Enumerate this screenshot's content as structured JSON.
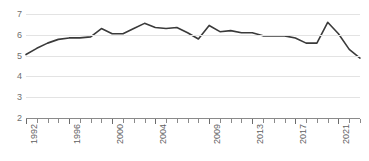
{
  "chart_data": {
    "type": "line",
    "title": "",
    "subtitle": "",
    "xlabel": "",
    "ylabel": "",
    "xlim": [
      1992,
      2023
    ],
    "ylim": [
      2,
      7
    ],
    "yticks": [
      2,
      3,
      4,
      5,
      6,
      7
    ],
    "ytick_labels": [
      "2",
      "3",
      "4",
      "5",
      "6",
      "7"
    ],
    "grid": true,
    "legend_position": "none",
    "x_tick_every": 1,
    "x_labeled_years": [
      "1992",
      "1996",
      "2000",
      "2004",
      "2009",
      "2013",
      "2017",
      "2021"
    ],
    "x": [
      1992,
      1993,
      1994,
      1995,
      1996,
      1997,
      1998,
      1999,
      2000,
      2001,
      2002,
      2003,
      2004,
      2005,
      2006,
      2007,
      2008,
      2009,
      2010,
      2011,
      2012,
      2013,
      2014,
      2015,
      2016,
      2017,
      2018,
      2019,
      2020,
      2021,
      2022,
      2023
    ],
    "series": [
      {
        "name": "value",
        "color": "#3a3a3a",
        "values": [
          5.05,
          5.35,
          5.6,
          5.78,
          5.85,
          5.85,
          5.9,
          6.3,
          6.05,
          6.05,
          6.3,
          6.55,
          6.35,
          6.3,
          6.35,
          6.1,
          5.8,
          6.45,
          6.15,
          6.2,
          6.1,
          6.1,
          5.95,
          5.95,
          5.95,
          5.85,
          5.6,
          5.6,
          6.6,
          6.05,
          5.3,
          4.88
        ]
      }
    ]
  },
  "axis": {
    "y_labels": [
      "7",
      "6",
      "5",
      "4",
      "3",
      "2"
    ],
    "x_labels": [
      "1992",
      "1996",
      "2000",
      "2004",
      "2009",
      "2013",
      "2017",
      "2021"
    ]
  },
  "colors": {
    "line": "#3a3a3a",
    "grid": "#e3e3e3",
    "axis": "#8a8a8a",
    "tick_text": "#5f5f5f",
    "background": "#ffffff"
  }
}
